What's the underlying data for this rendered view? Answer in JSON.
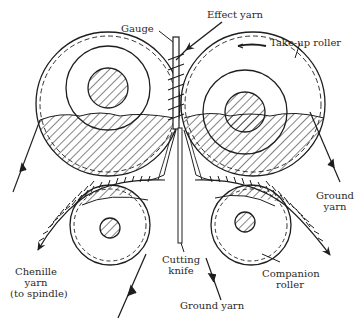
{
  "diagram": {
    "colors": {
      "ink": "#1e1e1e",
      "label": "#2a2a2a",
      "background": "#ffffff"
    },
    "labels": {
      "gauge": "Gauge",
      "effect_yarn": "Effect yarn",
      "take_up_roller": "Take-up roller",
      "ground_yarn_right_1": "Ground",
      "ground_yarn_right_2": "yarn",
      "chenille_1": "Chenille",
      "chenille_2": "yarn",
      "chenille_3": "(to spindle)",
      "cutting_knife_1": "Cutting",
      "cutting_knife_2": "knife",
      "companion_roller_1": "Companion",
      "companion_roller_2": "roller",
      "ground_yarn_bottom": "Ground yarn"
    },
    "components": [
      {
        "name": "Take-up roller (left)",
        "type": "large roller"
      },
      {
        "name": "Take-up roller (right)",
        "type": "large roller"
      },
      {
        "name": "Companion roller (left)",
        "type": "small roller"
      },
      {
        "name": "Companion roller (right)",
        "type": "small roller"
      },
      {
        "name": "Gauge",
        "type": "vertical plate"
      },
      {
        "name": "Cutting knife",
        "type": "vertical blade"
      }
    ]
  }
}
